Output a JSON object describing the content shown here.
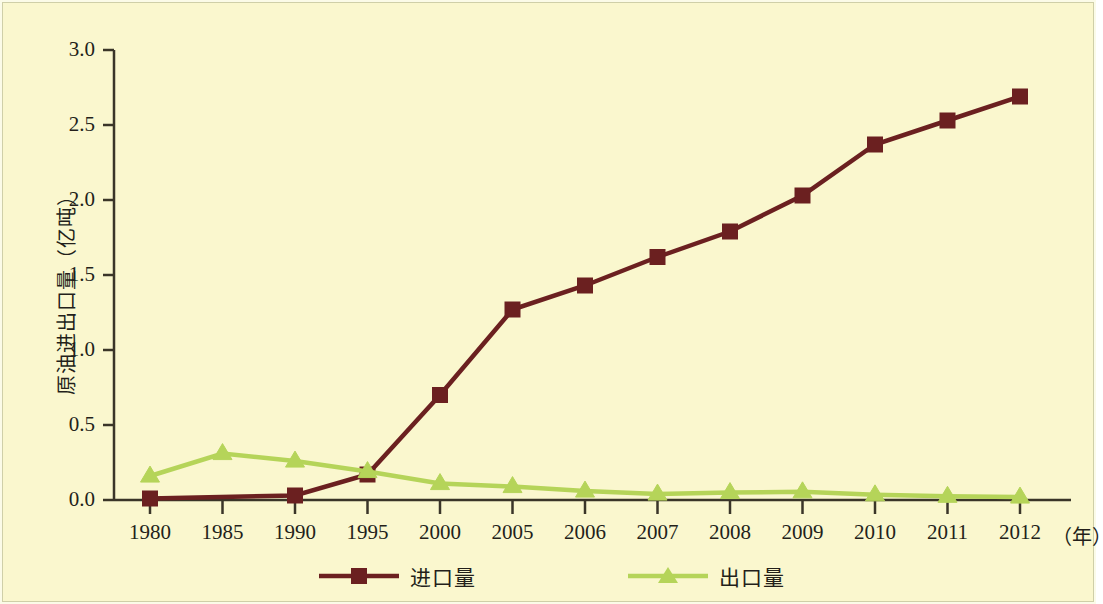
{
  "figure": {
    "background_color": "#faf7ce",
    "border_color": "#cfcfa8"
  },
  "chart_data": {
    "type": "line",
    "title": "",
    "subtitle": "",
    "xlabel": "（年）",
    "ylabel": "原油进出口量（亿吨）",
    "categories": [
      "1980",
      "1985",
      "1990",
      "1995",
      "2000",
      "2005",
      "2006",
      "2007",
      "2008",
      "2009",
      "2010",
      "2011",
      "2012"
    ],
    "xtick_labels": [
      "1980",
      "1985",
      "1990",
      "1995",
      "2000",
      "2005",
      "2006",
      "2007",
      "2008",
      "2009",
      "2010",
      "2011",
      "2012"
    ],
    "ytick_labels": [
      "0.0",
      "0.5",
      "1.0",
      "1.5",
      "2.0",
      "2.5",
      "3.0"
    ],
    "ytick_values": [
      0.0,
      0.5,
      1.0,
      1.5,
      2.0,
      2.5,
      3.0
    ],
    "ylim": [
      0.0,
      3.0
    ],
    "grid": false,
    "legend_position": "bottom-center",
    "series": [
      {
        "name": "进口量",
        "color": "#6b2020",
        "marker": "square",
        "values": [
          0.01,
          null,
          0.03,
          0.17,
          0.7,
          1.27,
          1.43,
          1.62,
          1.79,
          2.03,
          2.37,
          2.53,
          2.69
        ]
      },
      {
        "name": "出口量",
        "color": "#b5d459",
        "marker": "triangle",
        "values": [
          0.16,
          0.31,
          0.26,
          0.19,
          0.11,
          0.09,
          0.06,
          0.04,
          0.05,
          0.055,
          0.035,
          0.025,
          0.02
        ]
      }
    ]
  },
  "legend": {
    "items": [
      {
        "label": "进口量",
        "color": "#6b2020",
        "marker": "square"
      },
      {
        "label": "出口量",
        "color": "#b5d459",
        "marker": "triangle"
      }
    ]
  }
}
